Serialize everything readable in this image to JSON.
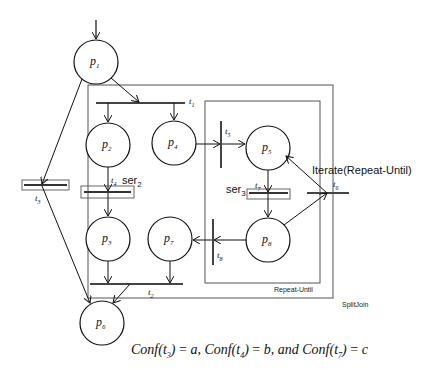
{
  "diagram": {
    "type": "petri-net",
    "places": [
      {
        "id": "p1",
        "label": "p",
        "sub": "1"
      },
      {
        "id": "p2",
        "label": "p",
        "sub": "2"
      },
      {
        "id": "p4",
        "label": "p",
        "sub": "4"
      },
      {
        "id": "p3",
        "label": "p",
        "sub": "3"
      },
      {
        "id": "p7",
        "label": "p",
        "sub": "7"
      },
      {
        "id": "p5",
        "label": "p",
        "sub": "5"
      },
      {
        "id": "p8",
        "label": "p",
        "sub": "8"
      },
      {
        "id": "p6",
        "label": "p",
        "sub": "6"
      }
    ],
    "transitions": [
      {
        "id": "t1",
        "label": "t",
        "sub": "1"
      },
      {
        "id": "t2",
        "label": "t",
        "sub": "2"
      },
      {
        "id": "t3",
        "label": "t",
        "sub": "3"
      },
      {
        "id": "t4",
        "label": "t",
        "sub": "4"
      },
      {
        "id": "t5",
        "label": "t",
        "sub": "5"
      },
      {
        "id": "t6",
        "label": "t",
        "sub": "6"
      },
      {
        "id": "t7",
        "label": "t",
        "sub": "7"
      },
      {
        "id": "t8",
        "label": "t",
        "sub": "8"
      }
    ],
    "annotations": {
      "ser2": {
        "text": "ser",
        "sub": "2"
      },
      "ser3": {
        "text": "ser",
        "sub": "3"
      },
      "iterate": "Iterate(Repeat-Until)"
    },
    "boxes": {
      "outer": "SplitJoin",
      "inner": "Repeat-Until"
    },
    "formula": {
      "part1_prefix": "Conf",
      "part1_arg": "t",
      "part1_sub": "3",
      "part1_val": "a,",
      "part2_prefix": "Conf",
      "part2_arg": "t",
      "part2_sub": "4",
      "part2_val": "b,",
      "conj": "and",
      "part3_prefix": "Conf",
      "part3_arg": "t",
      "part3_sub": "7",
      "part3_val": "c",
      "eq": "="
    }
  }
}
